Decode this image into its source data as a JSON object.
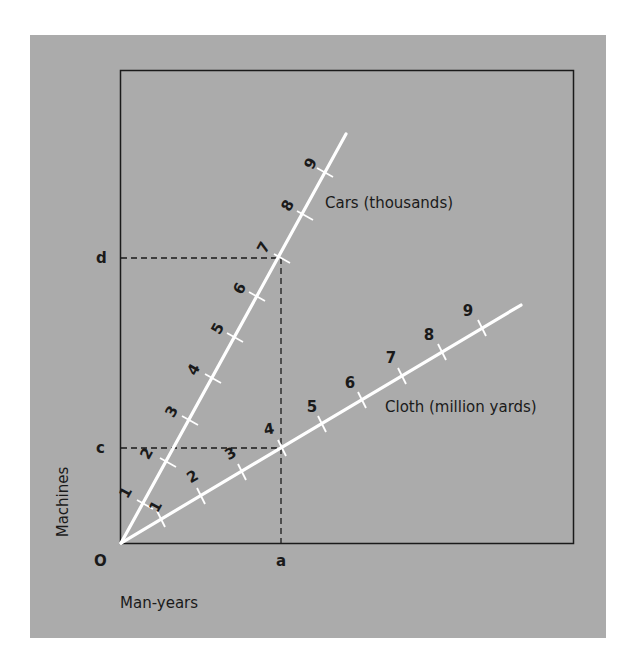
{
  "diagram": {
    "colors": {
      "page_bg": "#ffffff",
      "panel_bg": "#ababab",
      "frame": "#1a1a1a",
      "rays": "#ffffff",
      "dashes": "#1a1a1a",
      "text": "#1a1a1a"
    },
    "axes": {
      "y_label": "Machines",
      "x_label": "Man-years",
      "origin_label": "O",
      "y_marks": [
        {
          "label": "d",
          "y": 258
        },
        {
          "label": "c",
          "y": 448
        }
      ],
      "x_marks": [
        {
          "label": "a",
          "x": 281
        }
      ]
    },
    "rays": [
      {
        "name": "Cars (thousands)",
        "label": "Cars (thousands)",
        "ticks": [
          "1",
          "2",
          "3",
          "4",
          "5",
          "6",
          "7",
          "8",
          "9"
        ]
      },
      {
        "name": "Cloth (million yards)",
        "label": "Cloth (million yards)",
        "ticks": [
          "1",
          "2",
          "3",
          "4",
          "5",
          "6",
          "7",
          "8",
          "9"
        ]
      }
    ]
  }
}
